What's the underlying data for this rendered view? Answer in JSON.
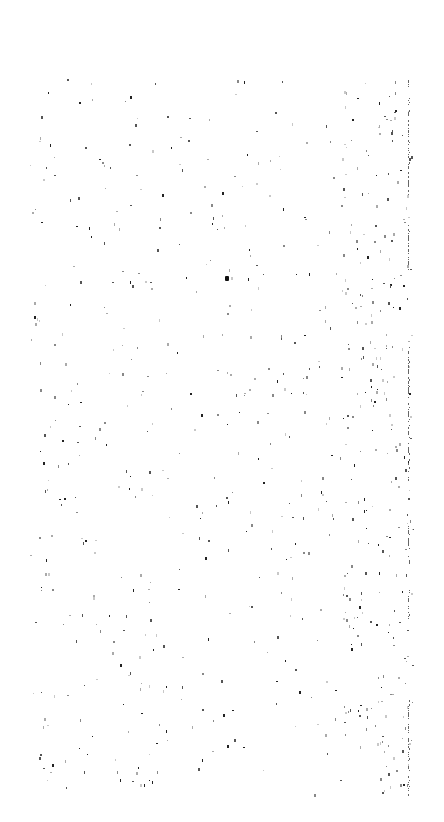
{
  "canvas": {
    "width": 444,
    "height": 822,
    "background": "#ffffff",
    "description": "Blank white page covered with sparse scanner-noise specks; no legible text or UI controls",
    "noise_region": {
      "x0": 30,
      "y0": 78,
      "x1": 412,
      "y1": 795
    },
    "speck_count": 700,
    "speck_colors": [
      "#222222",
      "#555555",
      "#888888",
      "#aaaaaa",
      "#c8c8c8"
    ]
  },
  "right_edge_line": {
    "x": 408,
    "segments": [
      [
        78,
        200
      ],
      [
        225,
        270
      ],
      [
        345,
        480
      ],
      [
        520,
        565
      ],
      [
        590,
        620
      ],
      [
        700,
        795
      ]
    ],
    "color": "#666666"
  },
  "blot": {
    "x": 225,
    "y": 276,
    "color": "#111111"
  }
}
